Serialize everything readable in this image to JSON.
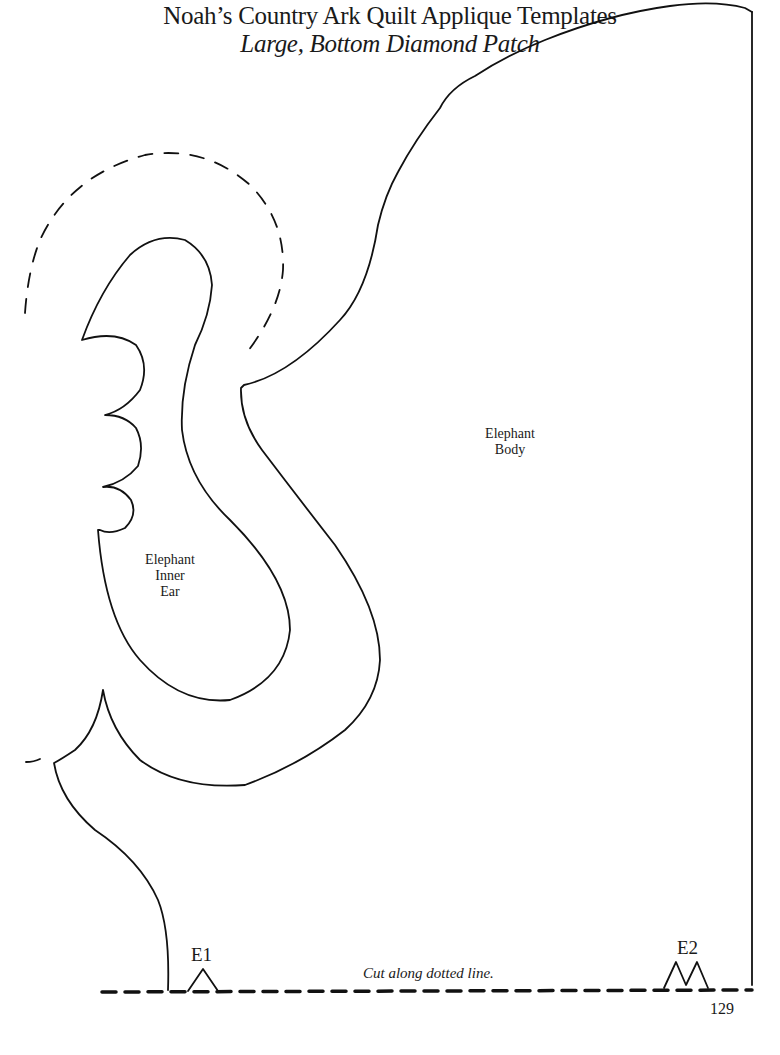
{
  "header": {
    "title": "Noah’s Country Ark Quilt Applique Templates",
    "subtitle": "Large, Bottom Diamond Patch"
  },
  "pieces": {
    "body_label": [
      "Elephant",
      "Body"
    ],
    "inner_ear_label": [
      "Elephant",
      "Inner",
      "Ear"
    ]
  },
  "notches": {
    "e1": "E1",
    "e2": "E2"
  },
  "instructions": {
    "cut_line": "Cut along dotted line."
  },
  "footer": {
    "page_number": "129"
  },
  "colors": {
    "line": "#111111",
    "background": "#ffffff"
  }
}
